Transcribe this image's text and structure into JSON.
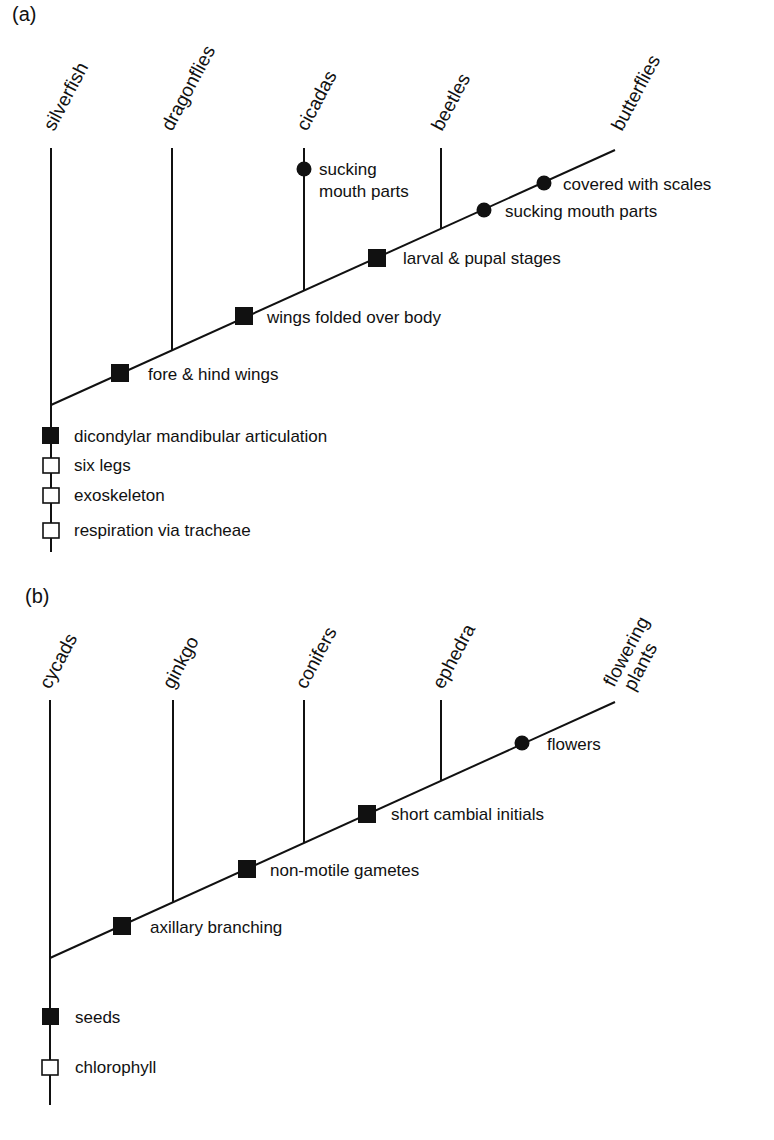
{
  "panels": [
    {
      "id": "a",
      "label": "(a)",
      "taxa": [
        "silverfish",
        "dragonflies",
        "cicadas",
        "beetles",
        "butterflies"
      ],
      "branch_characters": [
        {
          "text": "fore & hind wings",
          "marker": "filled-square"
        },
        {
          "text": "wings folded over body",
          "marker": "filled-square"
        },
        {
          "text": "larval & pupal stages",
          "marker": "filled-square"
        },
        {
          "text": "sucking mouth parts",
          "marker": "filled-circle"
        },
        {
          "text": "covered with scales",
          "marker": "filled-circle"
        }
      ],
      "cicada_character": {
        "line1": "sucking",
        "line2": "mouth parts",
        "marker": "filled-circle"
      },
      "root_characters": [
        {
          "text": "dicondylar mandibular articulation",
          "marker": "filled-square"
        },
        {
          "text": "six legs",
          "marker": "open-square"
        },
        {
          "text": "exoskeleton",
          "marker": "open-square"
        },
        {
          "text": "respiration via tracheae",
          "marker": "open-square"
        }
      ]
    },
    {
      "id": "b",
      "label": "(b)",
      "taxa": [
        "cycads",
        "ginkgo",
        "conifers",
        "ephedra",
        "flowering",
        "plants"
      ],
      "branch_characters": [
        {
          "text": "axillary branching",
          "marker": "filled-square"
        },
        {
          "text": "non-motile gametes",
          "marker": "filled-square"
        },
        {
          "text": "short cambial initials",
          "marker": "filled-square"
        },
        {
          "text": "flowers",
          "marker": "filled-circle"
        }
      ],
      "root_characters": [
        {
          "text": "seeds",
          "marker": "filled-square"
        },
        {
          "text": "chlorophyll",
          "marker": "open-square"
        }
      ]
    }
  ]
}
